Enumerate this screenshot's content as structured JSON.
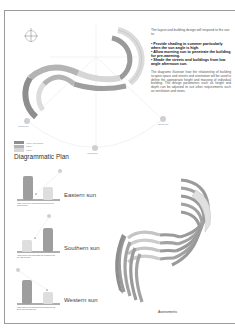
{
  "intro_text": "The layout and building design will respond to the sun to:",
  "bullets": [
    "• Provide shading in summer particularly when the sun angle is high.",
    "• Allow morning sun to penetrate the building for pre-warming.",
    "• Shade the streets and buildings from low angle afternoon sun."
  ],
  "body_text": "The diagrams illustrate how the relationship of building to open space and streets and orientation will be used to define the appropriate height and massing of individual building. The design parameters such as height and depth can be adjusted to suit other requirements such as ventilation and views.",
  "plan": {
    "title": "Diagrammatic Plan",
    "sun_labels": {
      "west": "Low angle sun",
      "south": "High angle sun",
      "east": "Low angle sun"
    },
    "legend": [
      {
        "label": "3 storey max building",
        "color": "#8e8e8e"
      },
      {
        "label": "2 storey",
        "color": "#b4b4b4"
      },
      {
        "label": "1 storey",
        "color": "#d6d6d6"
      }
    ]
  },
  "sections": [
    {
      "title": "Eastern sun",
      "caption": "Lower block to the east allows morning sun to pre-warm building"
    },
    {
      "title": "Southern sun",
      "caption": "Higher block to the south shade the building at mid-day with the street"
    },
    {
      "title": "Western sun",
      "caption": "Higher block to the west shade the building and the street from low angle sun"
    }
  ],
  "axonometric": {
    "title": "Axonometric"
  },
  "colors": {
    "dark_block": "#8e8e8e",
    "mid_block": "#b4b4b4",
    "light_block": "#dcdcdc",
    "guide_line": "#cfcfcf",
    "sun_disc": "#cccccc"
  }
}
